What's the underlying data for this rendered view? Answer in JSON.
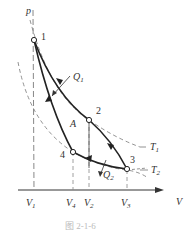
{
  "figure": {
    "caption": "图  2-1-6",
    "axes": {
      "y_label": "p",
      "x_label": "V"
    },
    "points": [
      {
        "id": "1",
        "label": "1"
      },
      {
        "id": "2",
        "label": "2"
      },
      {
        "id": "3",
        "label": "3"
      },
      {
        "id": "4",
        "label": "4"
      }
    ],
    "volume_ticks": [
      {
        "main": "V",
        "sub": "1"
      },
      {
        "main": "V",
        "sub": "4"
      },
      {
        "main": "V",
        "sub": "2"
      },
      {
        "main": "V",
        "sub": "3"
      }
    ],
    "isotherms": [
      {
        "main": "T",
        "sub": "1"
      },
      {
        "main": "T",
        "sub": "2"
      }
    ],
    "heat": [
      {
        "main": "Q",
        "sub": "1"
      },
      {
        "main": "Q",
        "sub": "2"
      }
    ],
    "area_label": "A",
    "colors": {
      "curve": "#222222",
      "dashed": "#777777",
      "axis": "#333333"
    }
  }
}
